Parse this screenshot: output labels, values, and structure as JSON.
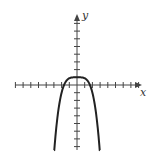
{
  "chart_data": {
    "type": "line",
    "title": "",
    "xlabel": "x",
    "ylabel": "y",
    "xlim": [
      -8,
      8
    ],
    "ylim": [
      -8,
      8
    ],
    "xticks": [
      -8,
      -7,
      -6,
      -5,
      -4,
      -3,
      -2,
      -1,
      1,
      2,
      3,
      4,
      5,
      6,
      7,
      8
    ],
    "yticks": [
      -8,
      -7,
      -6,
      -5,
      -4,
      -3,
      -2,
      -1,
      1,
      2,
      3,
      4,
      5,
      6,
      7,
      8
    ],
    "grid": false,
    "series": [
      {
        "name": "curve",
        "function": "y = 1 - (x/2)^4 * 2",
        "x": [
          -3,
          -2.75,
          -2.5,
          -2.25,
          -2,
          -1.75,
          -1.5,
          -1.25,
          -1,
          -0.5,
          0,
          0.5,
          1,
          1.25,
          1.5,
          1.75,
          2,
          2.25,
          2.5,
          2.75,
          3
        ],
        "y": [
          -8,
          -5.4,
          -3.8,
          -2.2,
          -0.2,
          0.2,
          0.5,
          0.7,
          0.9,
          1,
          1,
          1,
          0.9,
          0.7,
          0.5,
          0.2,
          -0.2,
          -2.2,
          -3.8,
          -5.4,
          -8
        ]
      }
    ],
    "colors": {
      "axis": "#444444",
      "curve": "#222222"
    }
  }
}
